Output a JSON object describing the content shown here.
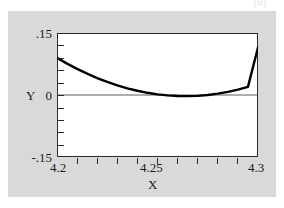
{
  "figure": {
    "panel_label": "(b)",
    "background_color": "#d9d9d9",
    "plot_background_color": "#ffffff",
    "axis_color": "#2b2b2b",
    "curve_color": "#000000"
  },
  "chart_data": {
    "type": "line",
    "title": "",
    "subtitle": "",
    "panel": "(b)",
    "xlabel": "X",
    "ylabel": "Y",
    "xlim": [
      4.2,
      4.3
    ],
    "ylim": [
      -0.15,
      0.15
    ],
    "grid": false,
    "legend": null,
    "x_tick_labels": [
      "4.2",
      "4.25",
      "4.3"
    ],
    "x_tick_label_values": [
      4.2,
      4.25,
      4.3
    ],
    "x_minor_ticks": [
      4.21,
      4.22,
      4.23,
      4.24,
      4.25,
      4.26,
      4.27,
      4.28,
      4.29
    ],
    "y_tick_labels": [
      ".15",
      "0",
      "-.15"
    ],
    "y_tick_label_values": [
      0.15,
      0.0,
      -0.15
    ],
    "y_minor_ticks": [
      0.12,
      0.09,
      0.06,
      0.03,
      -0.03,
      -0.06,
      -0.09,
      -0.12
    ],
    "zero_line": 0.0,
    "series": [
      {
        "name": "curve",
        "x": [
          4.2,
          4.205,
          4.21,
          4.215,
          4.22,
          4.225,
          4.23,
          4.235,
          4.24,
          4.245,
          4.25,
          4.255,
          4.26,
          4.265,
          4.27,
          4.275,
          4.28,
          4.285,
          4.29,
          4.295,
          4.3
        ],
        "y": [
          0.09,
          0.076,
          0.0632,
          0.0516,
          0.041,
          0.0316,
          0.0234,
          0.0162,
          0.0102,
          0.0053,
          0.0016,
          -0.001,
          -0.0025,
          -0.0028,
          -0.002,
          0.0,
          0.0032,
          0.0075,
          0.013,
          0.0196,
          0.115
        ]
      }
    ],
    "minimum": {
      "x": 4.264,
      "y": -0.0028
    },
    "endpoints": {
      "left": 0.09,
      "right": 0.115
    }
  },
  "axes": {
    "y_title": "Y",
    "x_title": "X",
    "y_top": ".15",
    "y_mid": "0",
    "y_bottom": "-.15",
    "x_left": "4.2",
    "x_mid": "4.25",
    "x_right": "4.3"
  }
}
